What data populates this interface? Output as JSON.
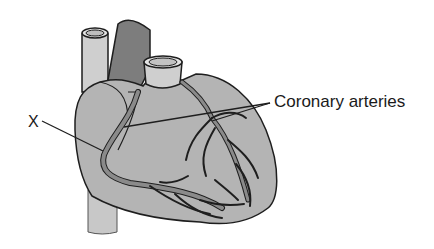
{
  "diagram": {
    "labels": {
      "x": "X",
      "coronary": "Coronary arteries"
    },
    "colors": {
      "heart": "#b4b4b4",
      "vessel_light": "#cfcfcf",
      "vessel_dark": "#7d7d7d",
      "artery": "#8a8a8a",
      "outline": "#1e1e1e"
    }
  }
}
